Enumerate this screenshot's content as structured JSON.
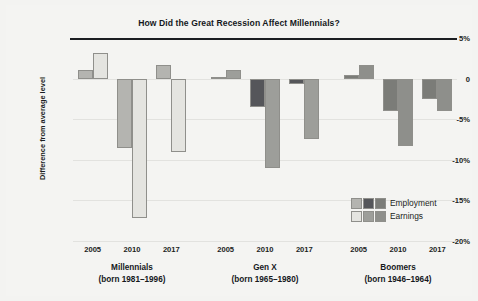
{
  "chart_data": {
    "type": "bar",
    "title": "How Did the Great Recession Affect Millennials?",
    "xlabel": "",
    "ylabel": "Difference from average level",
    "ylim": [
      -20,
      5
    ],
    "grid": true,
    "legend_position": "inside-bottom-right",
    "ytick_labels": [
      "5%",
      "0",
      "-5%",
      "-10%",
      "-15%",
      "-20%"
    ],
    "ytick_values": [
      5,
      0,
      -5,
      -10,
      -15,
      -20
    ],
    "categories": [
      "2005",
      "2010",
      "2017"
    ],
    "legend": [
      "Employment",
      "Earnings"
    ],
    "groups": [
      {
        "name": "Millennials",
        "subtitle": "(born 1981–1996)",
        "employment_color": "#b4b4b0",
        "earnings_color": "#e4e4e0",
        "series": [
          {
            "name": "Employment",
            "values": [
              1.1,
              -8.5,
              1.7
            ]
          },
          {
            "name": "Earnings",
            "values": [
              3.1,
              -17.2,
              -9.0
            ]
          }
        ]
      },
      {
        "name": "Gen X",
        "subtitle": "(born 1965–1980)",
        "employment_color": "#55565a",
        "earnings_color": "#9d9e9a",
        "series": [
          {
            "name": "Employment",
            "values": [
              0.2,
              -3.5,
              -0.7
            ]
          },
          {
            "name": "Earnings",
            "values": [
              1.0,
              -11.0,
              -7.5
            ]
          }
        ]
      },
      {
        "name": "Boomers",
        "subtitle": "(born 1946–1964)",
        "employment_color": "#7b7c78",
        "earnings_color": "#8e8f8b",
        "series": [
          {
            "name": "Employment",
            "values": [
              0.5,
              -4.0,
              -2.5
            ]
          },
          {
            "name": "Earnings",
            "values": [
              1.7,
              -8.3,
              -4.0
            ]
          }
        ]
      }
    ]
  },
  "legend_swatches": {
    "employment": [
      "#b4b4b0",
      "#55565a",
      "#7b7c78"
    ],
    "earnings": [
      "#e4e4e0",
      "#9d9e9a",
      "#8e8f8b"
    ]
  }
}
